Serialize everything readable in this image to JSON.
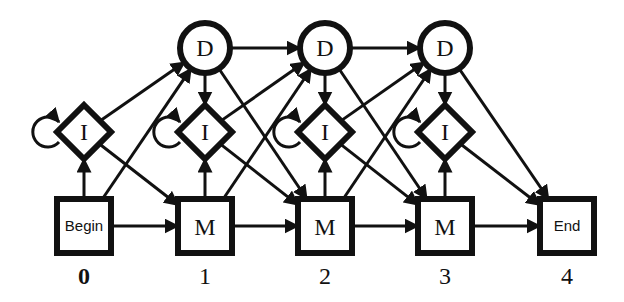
{
  "diagram": {
    "type": "profile-hmm",
    "colors": {
      "stroke": "#111111",
      "fill": "#ffffff",
      "text": "#111111"
    },
    "nodes": {
      "begin": {
        "label": "Begin",
        "kind": "square",
        "cx": 84,
        "cy": 226
      },
      "end": {
        "label": "End",
        "kind": "square",
        "cx": 567,
        "cy": 226
      },
      "matches": [
        {
          "label": "M",
          "cx": 205,
          "cy": 226
        },
        {
          "label": "M",
          "cx": 325,
          "cy": 226
        },
        {
          "label": "M",
          "cx": 445,
          "cy": 226
        }
      ],
      "inserts": [
        {
          "label": "I",
          "cx": 84,
          "cy": 132
        },
        {
          "label": "I",
          "cx": 205,
          "cy": 132
        },
        {
          "label": "I",
          "cx": 325,
          "cy": 132
        },
        {
          "label": "I",
          "cx": 445,
          "cy": 132
        }
      ],
      "deletes": [
        {
          "label": "D",
          "cx": 205,
          "cy": 48
        },
        {
          "label": "D",
          "cx": 325,
          "cy": 48
        },
        {
          "label": "D",
          "cx": 445,
          "cy": 48
        }
      ]
    },
    "position_labels": [
      {
        "text": "0",
        "x": 84,
        "bold": true
      },
      {
        "text": "1",
        "x": 205,
        "bold": false
      },
      {
        "text": "2",
        "x": 325,
        "bold": false
      },
      {
        "text": "3",
        "x": 445,
        "bold": false
      },
      {
        "text": "4",
        "x": 567,
        "bold": false
      }
    ]
  }
}
